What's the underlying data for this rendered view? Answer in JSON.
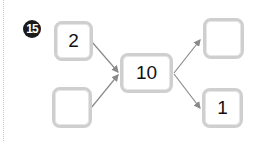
{
  "problem": {
    "number_badge": "15",
    "center_box": {
      "value": "10"
    },
    "left_top_box": {
      "value": "2"
    },
    "left_bottom_box": {
      "value": ""
    },
    "right_top_box": {
      "value": ""
    },
    "right_bottom_box": {
      "value": "1"
    }
  },
  "colors": {
    "box_border": "#cfcfcf",
    "arrow": "#8a8a8a",
    "badge_bg": "#1a1a1a"
  }
}
